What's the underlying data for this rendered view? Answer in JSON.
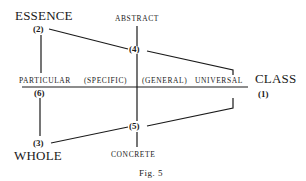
{
  "diagram": {
    "labels": {
      "essence": "ESSENCE",
      "abstract": "ABSTRACT",
      "particular": "PARTICULAR",
      "specific": "(SPECIFIC)",
      "general": "(GENERAL)",
      "universal": "UNIVERSAL",
      "class": "CLASS",
      "whole": "WHOLE",
      "concrete": "CONCRETE"
    },
    "nodes": {
      "n1": "(1)",
      "n2": "(2)",
      "n3": "(3)",
      "n4": "(4)",
      "n5": "(5)",
      "n6": "(6)"
    },
    "caption": "Fig. 5"
  }
}
